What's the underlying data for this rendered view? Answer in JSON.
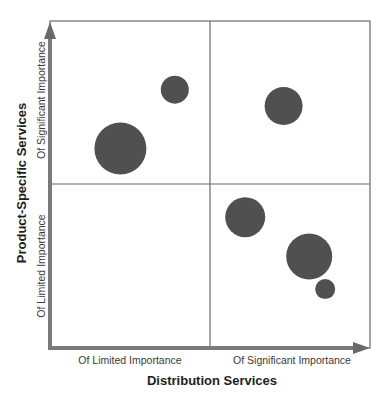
{
  "chart_data": {
    "type": "scatter",
    "subtype": "bubble-quadrant",
    "title": "",
    "xlabel": "Distribution Services",
    "ylabel": "Product-Specific Services",
    "x_tick_labels": [
      "Of Limited Importance",
      "Of Significant Importance"
    ],
    "y_tick_labels": [
      "Of Limited Importance",
      "Of Significant Importance"
    ],
    "xlim": [
      0,
      100
    ],
    "ylim": [
      0,
      100
    ],
    "grid": "quadrant dividers at midpoints",
    "legend": "none",
    "points": [
      {
        "x": 22,
        "y": 61,
        "size": 26
      },
      {
        "x": 39,
        "y": 79,
        "size": 14
      },
      {
        "x": 73,
        "y": 74,
        "size": 19
      },
      {
        "x": 61,
        "y": 40,
        "size": 20
      },
      {
        "x": 81,
        "y": 28,
        "size": 23
      },
      {
        "x": 86,
        "y": 18,
        "size": 10
      }
    ],
    "colors": {
      "bubble": "#505050",
      "axis": "#7a7a7a",
      "frame": "#666666"
    }
  },
  "labels": {
    "x_low": "Of Limited Importance",
    "x_high": "Of Significant Importance",
    "x_title": "Distribution Services",
    "y_low": "Of Limited Importance",
    "y_high": "Of Significant Importance",
    "y_title": "Product-Specific Services"
  }
}
